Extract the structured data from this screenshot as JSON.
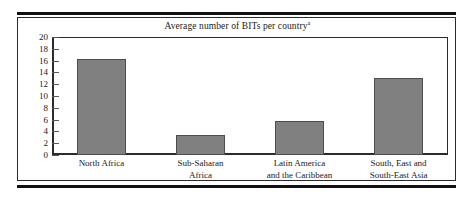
{
  "figure": {
    "title": "Average number of BITs per country",
    "title_superscript": "a"
  },
  "chart_data": {
    "type": "bar",
    "title": "Average number of BITs per country",
    "title_note": "a",
    "xlabel": "",
    "ylabel": "",
    "categories": [
      "North Africa",
      "Sub-Saharan Africa",
      "Latin America and the Caribbean",
      "South, East and South-East Asia"
    ],
    "category_lines": [
      [
        "North Africa"
      ],
      [
        "Sub-Saharan",
        "Africa"
      ],
      [
        "Latin America",
        "and the Caribbean"
      ],
      [
        "South, East and",
        "South-East Asia"
      ]
    ],
    "values": [
      16.3,
      3.4,
      5.7,
      13.1
    ],
    "ylim": [
      0,
      20
    ],
    "ytick_step": 2,
    "yticks": [
      0,
      2,
      4,
      6,
      8,
      10,
      12,
      14,
      16,
      18,
      20
    ],
    "ytick_labels": [
      "0",
      "2",
      "4",
      "6",
      "8",
      "10",
      "12",
      "14",
      "16",
      "18",
      "20"
    ],
    "grid": false,
    "legend": null,
    "bar_color": "#808080",
    "bar_edge_color": "#4d4d4d",
    "plot_background": "#ffffff",
    "axis_color": "#2b2b2b"
  }
}
